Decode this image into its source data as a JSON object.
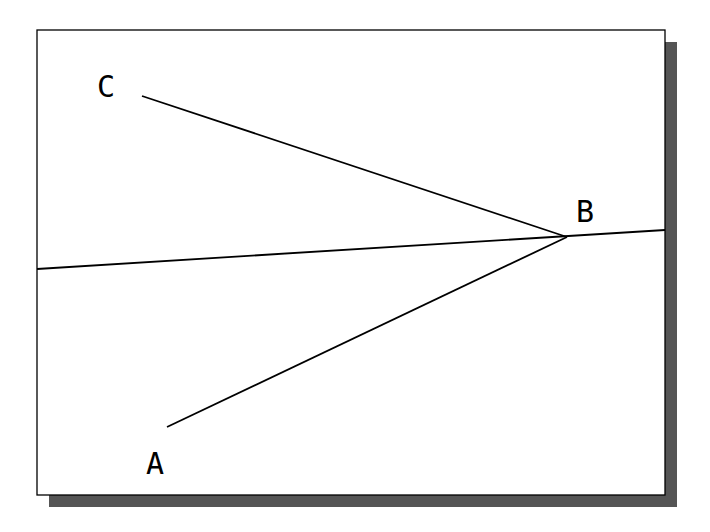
{
  "figure": {
    "frame": {
      "x": 37,
      "y": 30,
      "width": 628,
      "height": 465,
      "shadow_offset": 12,
      "shadow_color": "#555555",
      "border_color": "#000000"
    },
    "points": {
      "A": {
        "label": "A",
        "label_x": 146,
        "label_y": 474
      },
      "B": {
        "label": "B",
        "label_x": 576,
        "label_y": 222,
        "x": 567,
        "y": 237
      },
      "C": {
        "label": "C",
        "label_x": 97,
        "label_y": 97
      }
    },
    "segments": [
      {
        "name": "line-through-b",
        "x1": 37,
        "y1": 269,
        "x2": 665,
        "y2": 230
      },
      {
        "name": "segment-cb",
        "x1": 142,
        "y1": 96,
        "x2": 567,
        "y2": 237
      },
      {
        "name": "segment-ab",
        "x1": 167,
        "y1": 427,
        "x2": 567,
        "y2": 237
      }
    ]
  }
}
